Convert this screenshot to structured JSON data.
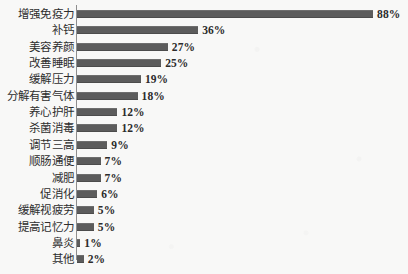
{
  "chart_data": {
    "type": "bar",
    "orientation": "horizontal",
    "title": "",
    "subtitle": "",
    "xlabel": "",
    "ylabel": "",
    "xlim": [
      0,
      88
    ],
    "grid": false,
    "legend": null,
    "value_suffix": "%",
    "bar_color": "#5c5c5c",
    "background_color": "#f8f8f7",
    "axis_color": "#8e8e8e",
    "categories": [
      "增强免疫力",
      "补钙",
      "美容养颜",
      "改善睡眠",
      "缓解压力",
      "分解有害气体",
      "养心护肝",
      "杀菌消毒",
      "调节三高",
      "顺肠通便",
      "减肥",
      "促消化",
      "缓解视疲劳",
      "提高记忆力",
      "鼻炎",
      "其他"
    ],
    "values": [
      88,
      36,
      27,
      25,
      19,
      18,
      12,
      12,
      9,
      7,
      7,
      6,
      5,
      5,
      1,
      2
    ],
    "value_labels": [
      "88%",
      "36%",
      "27%",
      "25%",
      "19%",
      "18%",
      "12%",
      "12%",
      "9%",
      "7%",
      "7%",
      "6%",
      "5%",
      "5%",
      "1%",
      "2%"
    ]
  }
}
